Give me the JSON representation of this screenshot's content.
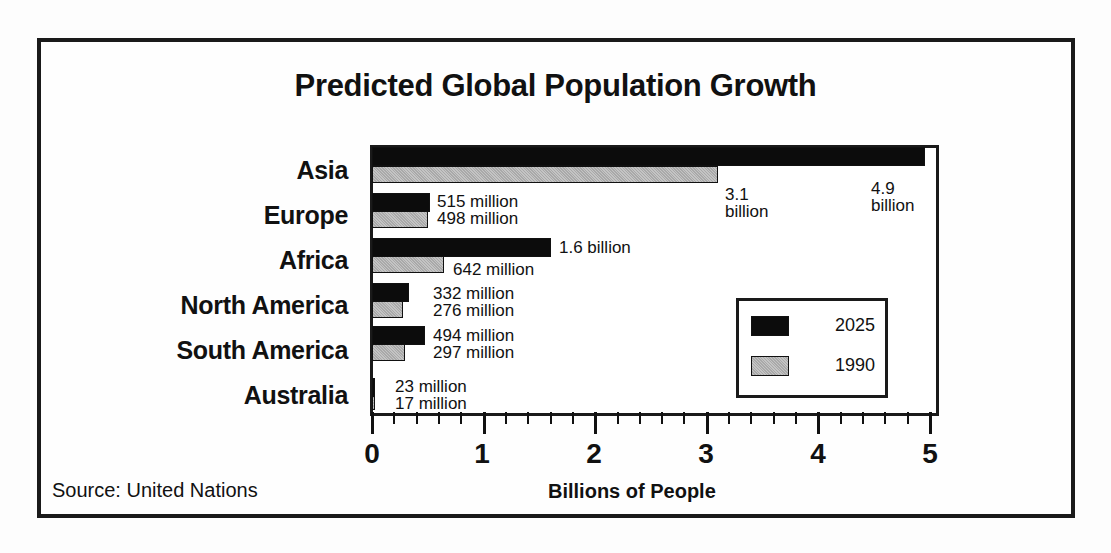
{
  "chart_data": {
    "type": "bar",
    "orientation": "horizontal",
    "title": "Predicted Global Population Growth",
    "xlabel": "Billions of People",
    "ylabel": "",
    "xlim": [
      0,
      5
    ],
    "x_ticks": [
      "0",
      "1",
      "2",
      "3",
      "4",
      "5"
    ],
    "minor_tick_step": 0.2,
    "grid": false,
    "legend_position": "lower right inside plot",
    "categories": [
      "Asia",
      "Europe",
      "Africa",
      "North America",
      "South America",
      "Australia"
    ],
    "series": [
      {
        "name": "2025",
        "color": "#0c0c0c",
        "values": [
          4.9,
          0.515,
          1.6,
          0.332,
          0.494,
          0.023
        ],
        "labels": [
          "4.9 billion",
          "515 million",
          "1.6 billion",
          "332 million",
          "494 million",
          "23 million"
        ]
      },
      {
        "name": "1990",
        "color": "#b8b8b8",
        "values": [
          3.1,
          0.498,
          0.642,
          0.276,
          0.297,
          0.017
        ],
        "labels": [
          "3.1 billion",
          "498 million",
          "642 million",
          "276 million",
          "297 million",
          "17 million"
        ]
      }
    ],
    "source": "Source:  United Nations"
  },
  "labels": {
    "asia_2025_l1": "4.9",
    "asia_2025_l2": "billion",
    "asia_1990_l1": "3.1",
    "asia_1990_l2": "billion"
  }
}
